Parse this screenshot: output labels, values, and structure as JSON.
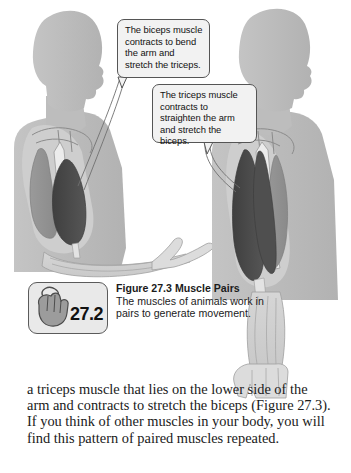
{
  "figure": {
    "callouts": [
      {
        "id": "biceps-callout",
        "text": "The biceps muscle contracts to bend the arm and stretch the triceps."
      },
      {
        "id": "triceps-callout",
        "text": "The triceps muscle contracts to straighten the arm and stretch the biceps."
      }
    ],
    "icon": {
      "name": "hand-mouse-icon",
      "number": "27.2"
    },
    "caption": {
      "title": "Figure 27.3  Muscle Pairs",
      "body": "The muscles of animals work in pairs to generate movement."
    }
  },
  "body": {
    "paragraph": "a triceps muscle that lies on the lower side of the arm and contracts to stretch the biceps (Figure 27.3). If you think of other muscles in your body, you will find this pattern of paired muscles repeated."
  },
  "colors": {
    "page_background": "#ffffff",
    "body_silhouette": "#b9b9b9",
    "body_silhouette_light": "#d2d2d2",
    "muscle_dark": "#4a4a4a",
    "muscle_mid": "#8f8f8f",
    "bone_light": "#e6e6e6",
    "outline": "#6f6f6f",
    "balloon_fill": "#f2f2f2",
    "balloon_border": "#555555",
    "text": "#111111"
  }
}
